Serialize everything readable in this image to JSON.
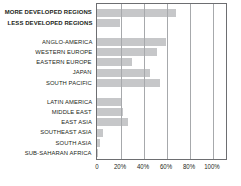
{
  "chart_data": {
    "type": "bar",
    "orientation": "horizontal",
    "title": "",
    "xlabel": "",
    "ylabel": "",
    "xlim": [
      0,
      112
    ],
    "grid": true,
    "legend": null,
    "tick_labels": [
      "0",
      "20%",
      "40%",
      "60%",
      "80%",
      "100%"
    ],
    "tick_values": [
      0,
      20,
      40,
      60,
      80,
      100
    ],
    "groups": [
      {
        "name": "world-totals",
        "emphasis": "bold",
        "rows": [
          {
            "label": "MORE DEVELOPED REGIONS",
            "value": 69
          },
          {
            "label": "LESS DEVELOPED REGIONS",
            "value": 20
          }
        ]
      },
      {
        "name": "developed-regions",
        "emphasis": "normal",
        "rows": [
          {
            "label": "ANGLO-AMERICA",
            "value": 60
          },
          {
            "label": "WESTERN EUROPE",
            "value": 52
          },
          {
            "label": "EASTERN EUROPE",
            "value": 30
          },
          {
            "label": "JAPAN",
            "value": 46
          },
          {
            "label": "SOUTH PACIFIC",
            "value": 55
          }
        ]
      },
      {
        "name": "developing-regions",
        "emphasis": "normal",
        "rows": [
          {
            "label": "LATIN AMERICA",
            "value": 21
          },
          {
            "label": "MIDDLE EAST",
            "value": 23
          },
          {
            "label": "EAST ASIA",
            "value": 27
          },
          {
            "label": "SOUTHEAST ASIA",
            "value": 5
          },
          {
            "label": "SOUTH ASIA",
            "value": 3
          },
          {
            "label": "SUB-SAHARAN AFRICA",
            "value": 0.8
          }
        ]
      }
    ],
    "categories": [
      "MORE DEVELOPED REGIONS",
      "LESS DEVELOPED REGIONS",
      "ANGLO-AMERICA",
      "WESTERN EUROPE",
      "EASTERN EUROPE",
      "JAPAN",
      "SOUTH PACIFIC",
      "LATIN AMERICA",
      "MIDDLE EAST",
      "EAST ASIA",
      "SOUTHEAST ASIA",
      "SOUTH ASIA",
      "SUB-SAHARAN AFRICA"
    ],
    "values": [
      69,
      20,
      60,
      52,
      30,
      46,
      55,
      21,
      23,
      27,
      5,
      3,
      0.8
    ],
    "colors": {
      "bar_fill": "#c6c7c9",
      "frame": "#6d6e71",
      "gridline": "#a7a9ac",
      "text": "#231f20",
      "background": "#ffffff"
    }
  }
}
